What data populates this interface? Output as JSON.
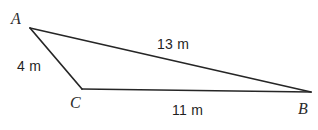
{
  "figure": {
    "type": "triangle-diagram",
    "background_color": "#ffffff",
    "stroke_color": "#262626",
    "stroke_width": 1.6,
    "width": 318,
    "height": 130,
    "vertices": [
      {
        "name": "A",
        "label": "A",
        "x": 30,
        "y": 28
      },
      {
        "name": "C",
        "label": "C",
        "x": 82,
        "y": 89
      },
      {
        "name": "B",
        "label": "B",
        "x": 311,
        "y": 92
      }
    ],
    "sides": [
      {
        "name": "AB",
        "from": "A",
        "to": "B",
        "label": "13 m",
        "value": 13,
        "unit": "m"
      },
      {
        "name": "AC",
        "from": "A",
        "to": "C",
        "label": "4 m",
        "value": 4,
        "unit": "m"
      },
      {
        "name": "CB",
        "from": "C",
        "to": "B",
        "label": "11 m",
        "value": 11,
        "unit": "m"
      }
    ]
  }
}
